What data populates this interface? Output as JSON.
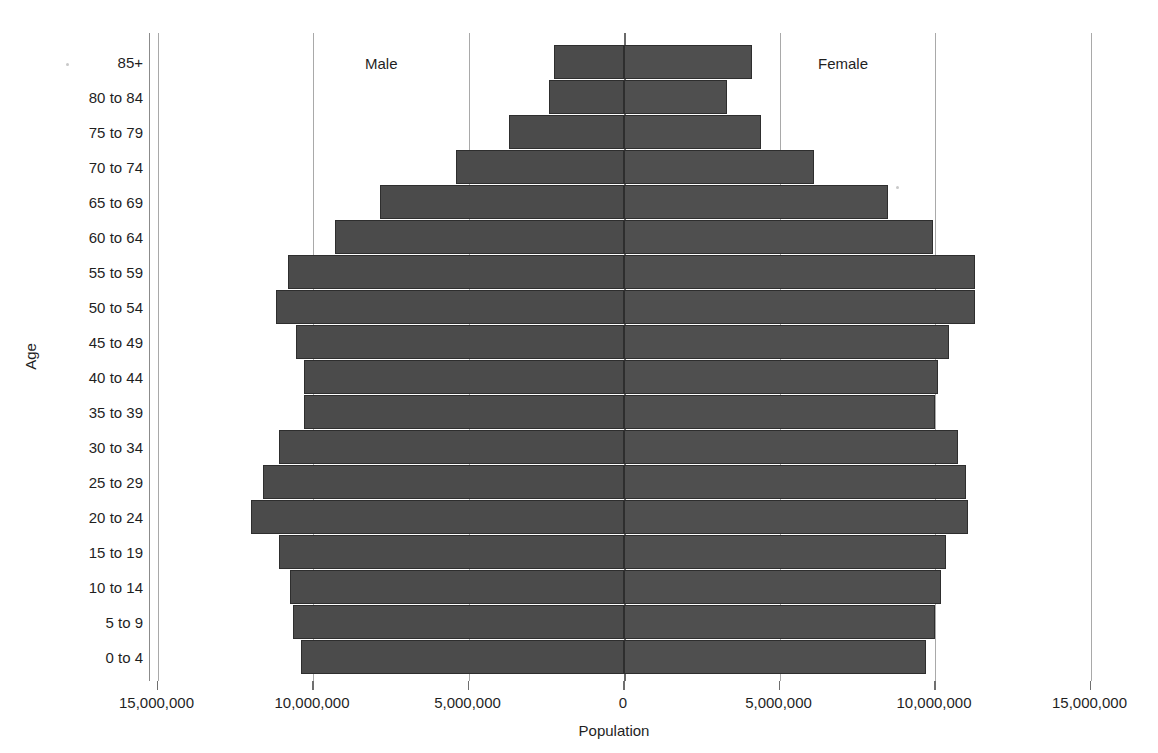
{
  "chart_data": {
    "type": "bar",
    "subtype": "population-pyramid",
    "title": "",
    "xlabel": "Population",
    "ylabel": "Age",
    "orientation": "horizontal",
    "grid": true,
    "legend_position": "in-plot-annotation",
    "xlim": [
      -15000000,
      15000000
    ],
    "xticks": [
      -15000000,
      -10000000,
      -5000000,
      0,
      5000000,
      10000000,
      15000000
    ],
    "xtick_labels": [
      "15,000,000",
      "10,000,000",
      "5,000,000",
      "0",
      "5,000,000",
      "10,000,000",
      "15,000,000"
    ],
    "categories": [
      "85+",
      "80 to 84",
      "75 to 79",
      "70 to 74",
      "65 to 69",
      "60 to 64",
      "55 to 59",
      "50 to 54",
      "45 to 49",
      "40 to 44",
      "35 to 39",
      "30 to 34",
      "25 to 29",
      "20 to 24",
      "15 to 19",
      "10 to 14",
      "5 to 9",
      "0 to 4"
    ],
    "series": [
      {
        "name": "Male",
        "side": "left",
        "color": "#4b4b4b",
        "values": [
          2250000,
          2400000,
          3700000,
          5400000,
          7850000,
          9300000,
          10800000,
          11200000,
          10550000,
          10300000,
          10300000,
          11100000,
          11600000,
          12000000,
          11100000,
          10750000,
          10650000,
          10400000
        ]
      },
      {
        "name": "Female",
        "side": "right",
        "color": "#4f4f4f",
        "values": [
          4100000,
          3300000,
          4400000,
          6100000,
          8500000,
          9950000,
          11300000,
          11300000,
          10450000,
          10100000,
          10000000,
          10750000,
          11000000,
          11050000,
          10350000,
          10200000,
          10000000,
          9700000
        ]
      }
    ],
    "annotations": [
      {
        "text": "Male",
        "position": "upper-left-of-plot"
      },
      {
        "text": "Female",
        "position": "upper-right-of-plot"
      }
    ]
  },
  "axes": {
    "y_title": "Age",
    "x_title": "Population"
  },
  "bleed_text": ""
}
